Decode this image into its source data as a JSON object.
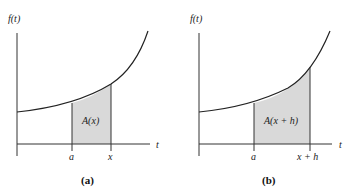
{
  "figure": {
    "panels": [
      {
        "caption": "(a)",
        "y_axis_label": "f(t)",
        "x_axis_label": "t",
        "tick_labels": [
          "a",
          "x"
        ],
        "area_label": "A(x)"
      },
      {
        "caption": "(b)",
        "y_axis_label": "f(t)",
        "x_axis_label": "t",
        "tick_labels": [
          "a",
          "x + h"
        ],
        "area_label": "A(x + h)"
      }
    ],
    "colors": {
      "curve": "#222222",
      "shade": "#d9d9d9",
      "axis": "#333333"
    }
  }
}
